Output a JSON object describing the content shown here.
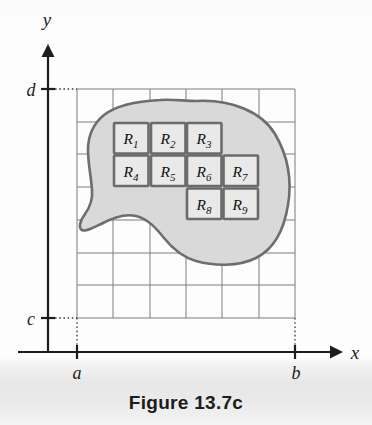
{
  "figure": {
    "caption": "Figure 13.7c",
    "axes": {
      "x_label": "x",
      "y_label": "y",
      "x_ticks": [
        {
          "name": "a-tick",
          "label": "a"
        },
        {
          "name": "b-tick",
          "label": "b"
        }
      ],
      "y_ticks": [
        {
          "name": "c-tick",
          "label": "c"
        },
        {
          "name": "d-tick",
          "label": "d"
        }
      ]
    },
    "grid": {
      "columns": 6,
      "rows": 7,
      "x_start": 77,
      "y_start": 89,
      "cell_width": 36.34,
      "cell_height": 32.72,
      "line_color": "#808080"
    },
    "region": {
      "name": "shaded-region",
      "fill_color": "#d9d9d9",
      "stroke_color": "#6b6b6b"
    },
    "subrectangles": {
      "stroke_color": "#6b6b6b",
      "fill_color": "#e8e8e8",
      "items": [
        {
          "id": "R1",
          "base": "R",
          "sub": "1",
          "col": 1,
          "row": 1
        },
        {
          "id": "R2",
          "base": "R",
          "sub": "2",
          "col": 2,
          "row": 1
        },
        {
          "id": "R3",
          "base": "R",
          "sub": "3",
          "col": 3,
          "row": 1
        },
        {
          "id": "R4",
          "base": "R",
          "sub": "4",
          "col": 1,
          "row": 2
        },
        {
          "id": "R5",
          "base": "R",
          "sub": "5",
          "col": 2,
          "row": 2
        },
        {
          "id": "R6",
          "base": "R",
          "sub": "6",
          "col": 3,
          "row": 2
        },
        {
          "id": "R7",
          "base": "R",
          "sub": "7",
          "col": 4,
          "row": 2
        },
        {
          "id": "R8",
          "base": "R",
          "sub": "8",
          "col": 3,
          "row": 3
        },
        {
          "id": "R9",
          "base": "R",
          "sub": "9",
          "col": 4,
          "row": 3
        }
      ]
    },
    "colors": {
      "axis": "#1d1d1d",
      "grid_line": "#7d7d7d",
      "region_fill": "#d9d9d9",
      "region_outline": "#6d6d6d",
      "rect_outline": "#6b6b6b",
      "rect_fill": "#e9e9e9",
      "text": "#181818",
      "caption_band": "#e7e7e7"
    }
  }
}
